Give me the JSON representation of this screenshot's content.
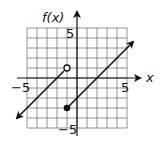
{
  "chart_data": {
    "type": "line",
    "title": "",
    "xlabel": "x",
    "ylabel": "f(x)",
    "xlim": [
      -5,
      5
    ],
    "ylim": [
      -5,
      5
    ],
    "grid": true,
    "grid_step": 1,
    "tick_labels": {
      "x": [
        "-5",
        "5"
      ],
      "y": [
        "5",
        "-5"
      ]
    },
    "series": [
      {
        "name": "left piece",
        "formula": "f(x) = x + 2, x < -1",
        "points": [
          [
            -6,
            -4
          ],
          [
            -1,
            1
          ]
        ],
        "end_marker": {
          "x": -1,
          "y": 1,
          "style": "open"
        },
        "arrow_at": "start"
      },
      {
        "name": "right piece",
        "formula": "f(x) = x - 2, x >= -1",
        "points": [
          [
            -1,
            -3
          ],
          [
            5.5,
            3.5
          ]
        ],
        "end_marker": {
          "x": -1,
          "y": -3,
          "style": "closed"
        },
        "arrow_at": "end"
      }
    ]
  },
  "labels": {
    "y_axis": "f(x)",
    "x_axis": "x",
    "x_min": "−5",
    "x_max": "5",
    "y_max": "5",
    "y_min": "−5"
  }
}
